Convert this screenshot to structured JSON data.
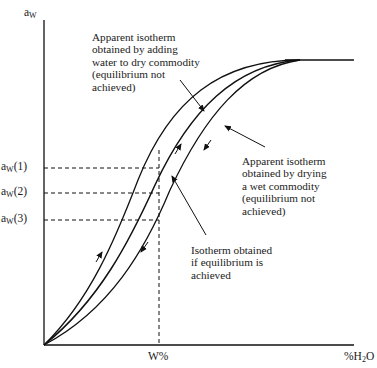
{
  "diagram": {
    "y_axis": {
      "label_main": "a",
      "label_sub": "W"
    },
    "x_axis": {
      "label_pct": "%",
      "label_h": "H",
      "label_sub": "2",
      "label_o": "O",
      "marker_label": "W%"
    },
    "y_markers": [
      {
        "main": "a",
        "sub": "W",
        "suffix": "(1)"
      },
      {
        "main": "a",
        "sub": "W",
        "suffix": "(2)"
      },
      {
        "main": "a",
        "sub": "W",
        "suffix": "(3)"
      }
    ],
    "annotations": {
      "adsorption": [
        "Apparent isotherm",
        "obtained by adding",
        "water to dry commodity",
        "(equilibrium not",
        "achieved)"
      ],
      "desorption": [
        "Apparent isotherm",
        "obtained by drying",
        "a wet commodity",
        "(equilibrium not",
        "achieved)"
      ],
      "equilibrium": [
        "Isotherm obtained",
        "if equilibrium is",
        "achieved"
      ]
    },
    "curves": [
      {
        "name": "adsorption-curve",
        "direction": "up"
      },
      {
        "name": "equilibrium-curve",
        "direction": "none"
      },
      {
        "name": "desorption-curve",
        "direction": "down"
      }
    ],
    "colors": {
      "line": "#111111",
      "background": "#ffffff"
    }
  }
}
